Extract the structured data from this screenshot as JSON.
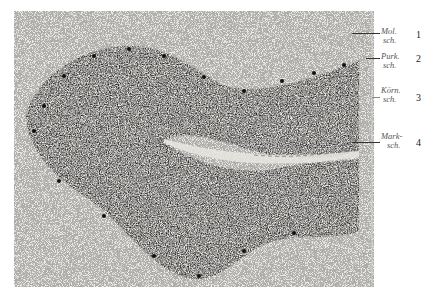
{
  "figure": {
    "type": "histological micrograph"
  },
  "labels": [
    {
      "id": 1,
      "text_line1": "Mol.",
      "text_line2": "sch.",
      "number": "1"
    },
    {
      "id": 2,
      "text_line1": "Purk.",
      "text_line2": "sch.",
      "number": "2"
    },
    {
      "id": 3,
      "text_line1": "Körn.",
      "text_line2": "sch.",
      "number": "3"
    },
    {
      "id": 4,
      "text_line1": "Mark-",
      "text_line2": "sch.",
      "number": "4"
    }
  ],
  "colors": {
    "background": "#ecebe6",
    "tissue_dark": "#1a1a1a",
    "tissue_mid": "#3a3a3a"
  }
}
